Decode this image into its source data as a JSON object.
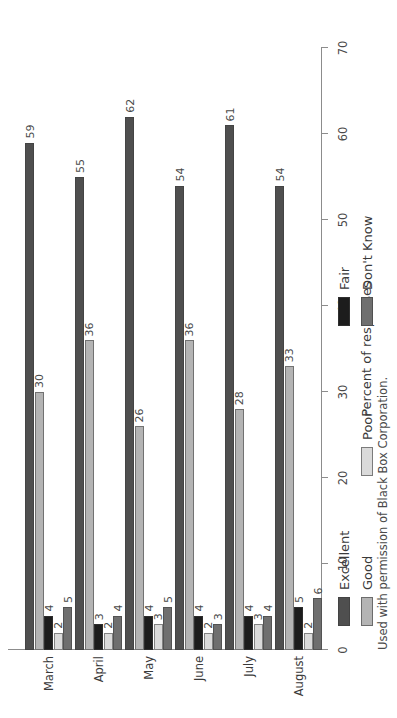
{
  "chart_data": {
    "type": "bar",
    "orientation": "horizontal",
    "title": "",
    "xlabel": "Percent of responses",
    "ylabel": "",
    "xlim": [
      0,
      70
    ],
    "xticks": [
      0,
      10,
      20,
      30,
      40,
      50,
      60,
      70
    ],
    "grid": false,
    "legend_position": "below-plot",
    "categories": [
      "March",
      "April",
      "May",
      "June",
      "July",
      "August"
    ],
    "series": [
      {
        "name": "Excellent",
        "color": "#4f4f4f",
        "values": [
          59,
          55,
          62,
          54,
          61,
          54
        ]
      },
      {
        "name": "Good",
        "color": "#b4b4b4",
        "values": [
          30,
          36,
          26,
          36,
          28,
          33
        ]
      },
      {
        "name": "Fair",
        "color": "#1c1c1c",
        "values": [
          4,
          3,
          4,
          4,
          4,
          5
        ]
      },
      {
        "name": "Poor",
        "color": "#dadada",
        "values": [
          2,
          2,
          3,
          2,
          3,
          2
        ]
      },
      {
        "name": "Don't Know",
        "color": "#6f6f6f",
        "values": [
          5,
          4,
          5,
          3,
          4,
          6
        ]
      }
    ],
    "data_labels": true
  },
  "axis": {
    "value_axis_title": "Percent of responses",
    "tick_labels": [
      "0",
      "10",
      "20",
      "30",
      "40",
      "50",
      "60",
      "70"
    ]
  },
  "legend": {
    "entries": [
      {
        "label": "Excellent",
        "color": "#4f4f4f"
      },
      {
        "label": "Fair",
        "color": "#1c1c1c"
      },
      {
        "label": "Good",
        "color": "#b4b4b4"
      },
      {
        "label": "Poor",
        "color": "#dadada"
      },
      {
        "label": "Don't Know",
        "color": "#6f6f6f"
      }
    ]
  },
  "caption": {
    "text": "Used with permission of Black Box Corporation."
  }
}
